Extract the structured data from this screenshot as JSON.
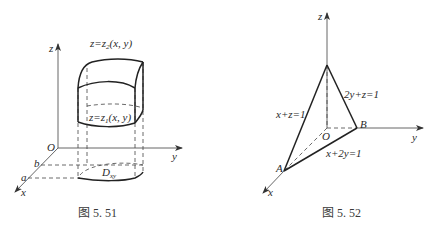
{
  "figures": [
    {
      "id": "fig-5-51",
      "caption": "图 5. 51",
      "labels": {
        "z_axis": "z",
        "y_axis": "y",
        "x_axis": "x",
        "origin": "O",
        "a": "a",
        "b": "b",
        "top_surface": "z=z",
        "top_surface_sub": "2",
        "top_surface_args": "(x, y)",
        "bottom_surface": "z=z",
        "bottom_surface_sub": "1",
        "bottom_surface_args": "(x, y)",
        "region": "D",
        "region_sub": "xy"
      }
    },
    {
      "id": "fig-5-52",
      "caption": "图 5. 52",
      "labels": {
        "z_axis": "z",
        "y_axis": "y",
        "x_axis": "x",
        "origin": "O",
        "point_a": "A",
        "point_b": "B",
        "plane_xz": "x+z=1",
        "plane_yz": "2y+z=1",
        "line_xy": "x+2y=1"
      }
    }
  ],
  "colors": {
    "line": "#222222",
    "axis": "#555555",
    "background": "#ffffff"
  }
}
